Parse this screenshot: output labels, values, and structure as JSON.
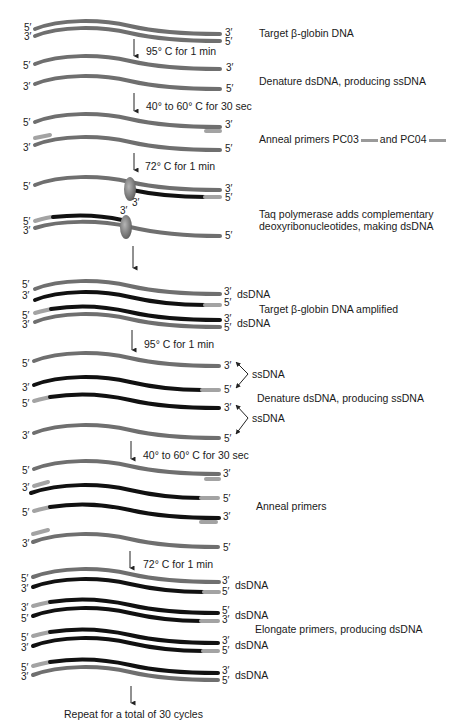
{
  "colors": {
    "template_strand": "#6f6f6f",
    "new_strand": "#111111",
    "primer": "#a3a3a3",
    "polymerase": "#7a7a7a",
    "arrow": "#222222"
  },
  "steps": {
    "s1": "Target β-globin DNA",
    "s2": "Denature dsDNA, producing ssDNA",
    "s3_pre": "Anneal primers PC03",
    "s3_mid": "and PC04",
    "s4": "Taq polymerase adds complementary",
    "s4b": "deoxyribonucleotides, making dsDNA",
    "s5": "Target β-globin DNA amplified",
    "s6": "Denature dsDNA, producing ssDNA",
    "s7": "Anneal primers",
    "s8": "Elongate primers, producing dsDNA",
    "final": "Repeat for a total of 30 cycles"
  },
  "conditions": {
    "c1": "95° C for 1 min",
    "c2": "40° to 60° C for 30 sec",
    "c3": "72° C for 1 min",
    "c4": "95° C for 1 min",
    "c5": "40° to 60° C for 30 sec",
    "c6": "72° C for 1 min"
  },
  "tags": {
    "dsDNA": "dsDNA",
    "ssDNA": "ssDNA"
  },
  "ends": {
    "five": "5′",
    "three": "3′"
  }
}
